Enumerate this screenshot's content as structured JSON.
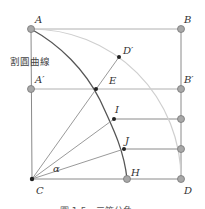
{
  "diagram": {
    "curve_label": "割圓曲線",
    "angle_label": "α",
    "caption": "圖 1-5　三等分角",
    "points": {
      "A": {
        "label": "A",
        "x": 31,
        "y": 29
      },
      "B": {
        "label": "B",
        "x": 181,
        "y": 29
      },
      "A_prime": {
        "label": "A′",
        "x": 31,
        "y": 89
      },
      "B_prime": {
        "label": "B′",
        "x": 181,
        "y": 89
      },
      "C": {
        "label": "C",
        "x": 32,
        "y": 179
      },
      "D": {
        "label": "D",
        "x": 181,
        "y": 179
      },
      "D_prime": {
        "label": "D′",
        "x": 119,
        "y": 57
      },
      "E": {
        "label": "E",
        "x": 96,
        "y": 89
      },
      "I": {
        "label": "I",
        "x": 114,
        "y": 119
      },
      "J": {
        "label": "J",
        "x": 124,
        "y": 149
      },
      "H": {
        "label": "H",
        "x": 127,
        "y": 179
      }
    },
    "colors": {
      "square": "#9a9a9a",
      "quadratrix": "#555555",
      "circle_arc": "#c8c8c8",
      "rays": "#9a9a9a",
      "node_fill": "#a8a8a8",
      "node_stroke": "#777777",
      "point_fill": "#222222"
    }
  }
}
